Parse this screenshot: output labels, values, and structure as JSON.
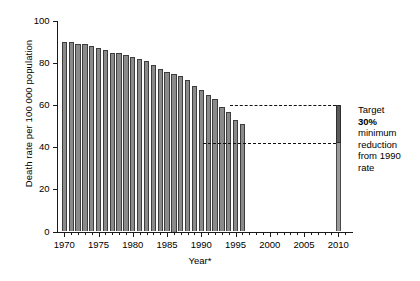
{
  "chart_data": {
    "type": "bar",
    "title": "",
    "xlabel": "Year*",
    "ylabel": "Death rate per 100 000 population",
    "xlim": [
      1969,
      2012
    ],
    "ylim": [
      0,
      100
    ],
    "ytick_values": [
      0,
      20,
      40,
      60,
      80,
      100
    ],
    "ytick_labels": [
      "0",
      "20",
      "40",
      "60",
      "80",
      "100"
    ],
    "xtick_values": [
      1970,
      1975,
      1980,
      1985,
      1990,
      1995,
      2000,
      2005,
      2010
    ],
    "xtick_labels": [
      "1970",
      "1975",
      "1980",
      "1985",
      "1990",
      "1995",
      "2000",
      "2005",
      "2010"
    ],
    "xtick_minor_step": 1,
    "grid": false,
    "legend": false,
    "bar_color": "#8a8a8a",
    "bar_edge_color": "#3d3d3d",
    "categories": [
      1970,
      1971,
      1972,
      1973,
      1974,
      1975,
      1976,
      1977,
      1978,
      1979,
      1980,
      1981,
      1982,
      1983,
      1984,
      1985,
      1986,
      1987,
      1988,
      1989,
      1990,
      1991,
      1992,
      1993,
      1994,
      1995,
      1996
    ],
    "values": [
      90,
      90,
      89,
      89,
      88,
      87,
      86,
      85,
      85,
      84,
      83,
      82,
      81,
      79,
      77,
      76,
      75,
      74,
      72,
      69,
      67,
      65,
      63,
      59,
      57,
      53,
      51
    ],
    "reference_lines": [
      {
        "name": "baseline-1990-rate",
        "value": 60,
        "style": "dashed",
        "color": "#111111"
      },
      {
        "name": "target-reduced-rate",
        "value": 42,
        "style": "dashed",
        "color": "#111111"
      }
    ],
    "target_bar": {
      "x": 2010,
      "top_value": 60,
      "reduction_band_low": 42,
      "band_color": "#5a5a5a",
      "stem_color": "#9a9a9a"
    },
    "annotation": {
      "line1": "Target",
      "line2": "30%",
      "line3": "minimum",
      "line4": "reduction",
      "line5": "from 1990",
      "line6": "rate"
    }
  }
}
